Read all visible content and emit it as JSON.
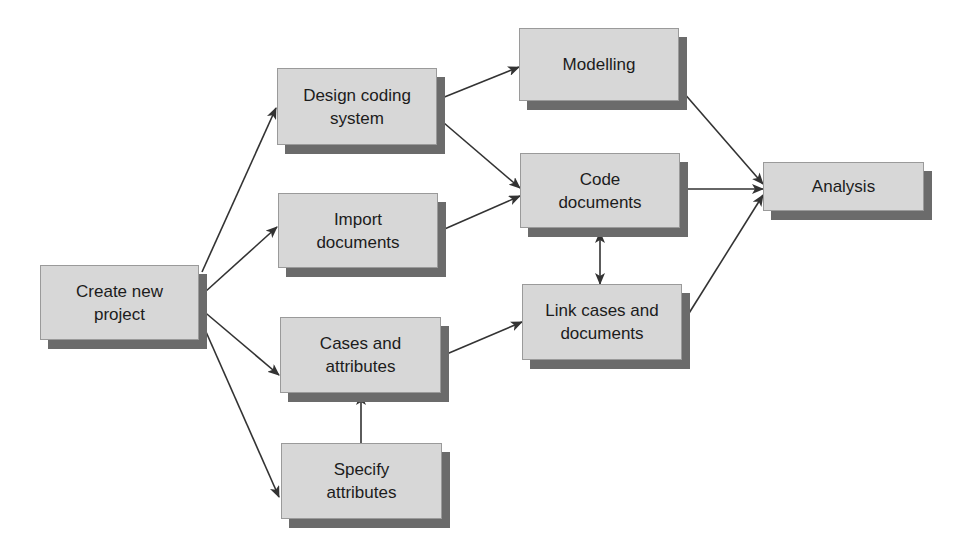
{
  "diagram": {
    "colors": {
      "box_fill": "#d7d7d7",
      "box_border": "#9a9a9a",
      "box_shadow": "#6b6b6b",
      "arrow": "#333333",
      "text": "#1c1c1c"
    },
    "nodes": [
      {
        "id": "create",
        "label": "Create new\nproject",
        "x": 40,
        "y": 265,
        "w": 159,
        "h": 75
      },
      {
        "id": "design",
        "label": "Design coding\nsystem",
        "x": 277,
        "y": 68,
        "w": 160,
        "h": 77
      },
      {
        "id": "import",
        "label": "Import\ndocuments",
        "x": 278,
        "y": 193,
        "w": 160,
        "h": 75
      },
      {
        "id": "cases",
        "label": "Cases and\nattributes",
        "x": 280,
        "y": 317,
        "w": 161,
        "h": 76
      },
      {
        "id": "specify",
        "label": "Specify\nattributes",
        "x": 281,
        "y": 443,
        "w": 161,
        "h": 76
      },
      {
        "id": "modelling",
        "label": "Modelling",
        "x": 519,
        "y": 28,
        "w": 160,
        "h": 73
      },
      {
        "id": "code",
        "label": "Code\ndocuments",
        "x": 520,
        "y": 153,
        "w": 160,
        "h": 75
      },
      {
        "id": "link",
        "label": "Link cases and\ndocuments",
        "x": 522,
        "y": 284,
        "w": 160,
        "h": 76
      },
      {
        "id": "analysis",
        "label": "Analysis",
        "x": 763,
        "y": 162,
        "w": 161,
        "h": 49
      }
    ],
    "edges": [
      {
        "from": "create",
        "to": "design",
        "x1": 202,
        "y1": 272,
        "x2": 276,
        "y2": 108,
        "bidirectional": false
      },
      {
        "from": "create",
        "to": "import",
        "x1": 205,
        "y1": 292,
        "x2": 277,
        "y2": 227,
        "bidirectional": false
      },
      {
        "from": "create",
        "to": "cases",
        "x1": 201,
        "y1": 309,
        "x2": 279,
        "y2": 375,
        "bidirectional": false
      },
      {
        "from": "create",
        "to": "specify",
        "x1": 199,
        "y1": 316,
        "x2": 279,
        "y2": 497,
        "bidirectional": false
      },
      {
        "from": "design",
        "to": "modelling",
        "x1": 437,
        "y1": 100,
        "x2": 519,
        "y2": 67,
        "bidirectional": false
      },
      {
        "from": "design",
        "to": "code",
        "x1": 437,
        "y1": 117,
        "x2": 520,
        "y2": 188,
        "bidirectional": false
      },
      {
        "from": "import",
        "to": "code",
        "x1": 440,
        "y1": 231,
        "x2": 520,
        "y2": 196,
        "bidirectional": false
      },
      {
        "from": "cases",
        "to": "link",
        "x1": 442,
        "y1": 356,
        "x2": 522,
        "y2": 322,
        "bidirectional": false
      },
      {
        "from": "specify",
        "to": "cases",
        "x1": 361,
        "y1": 443,
        "x2": 361,
        "y2": 394,
        "bidirectional": false
      },
      {
        "from": "code",
        "to": "link",
        "x1": 600,
        "y1": 232,
        "x2": 600,
        "y2": 284,
        "bidirectional": true
      },
      {
        "from": "modelling",
        "to": "analysis",
        "x1": 683,
        "y1": 92,
        "x2": 763,
        "y2": 184,
        "bidirectional": false
      },
      {
        "from": "code",
        "to": "analysis",
        "x1": 684,
        "y1": 189,
        "x2": 763,
        "y2": 189,
        "bidirectional": false
      },
      {
        "from": "link",
        "to": "analysis",
        "x1": 686,
        "y1": 318,
        "x2": 763,
        "y2": 195,
        "bidirectional": false
      }
    ]
  }
}
